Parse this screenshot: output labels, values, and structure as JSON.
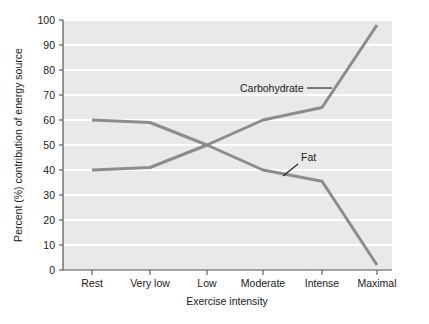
{
  "chart_data": {
    "type": "line",
    "title": "",
    "subtitle": "",
    "xlabel": "Exercise intensity",
    "ylabel": "Percent (%) contribution of energy source",
    "categories": [
      "Rest",
      "Very low",
      "Low",
      "Moderate",
      "Intense",
      "Maximal"
    ],
    "series": [
      {
        "name": "Carbohydrate",
        "color": "#8c8c8c",
        "values": [
          40,
          41,
          50,
          60,
          65,
          98
        ]
      },
      {
        "name": "Fat",
        "color": "#8c8c8c",
        "values": [
          60,
          59,
          50,
          40,
          35.5,
          2
        ]
      }
    ],
    "ylim": [
      0,
      100
    ],
    "ytick_step": 10,
    "yticks": [
      "0",
      "10",
      "20",
      "30",
      "40",
      "50",
      "60",
      "70",
      "80",
      "90",
      "100"
    ],
    "grid": "horizontal-white-gridlines",
    "legend": "none-inline-annotations",
    "annotations": [
      {
        "text": "Carbohydrate",
        "series": "Carbohydrate",
        "leader": "horizontal-dash-right"
      },
      {
        "text": "Fat",
        "series": "Fat",
        "leader": "diagonal-down-left"
      }
    ],
    "plot_background": "#e9e9e9",
    "gridline_color": "#ffffff",
    "axis_color": "#555555"
  },
  "axis": {
    "y_title": "Percent (%) contribution of energy source",
    "x_title": "Exercise intensity",
    "y_ticks": [
      "100",
      "90",
      "80",
      "70",
      "60",
      "50",
      "40",
      "30",
      "20",
      "10",
      "0"
    ],
    "x_ticks": [
      "Rest",
      "Very low",
      "Low",
      "Moderate",
      "Intense",
      "Maximal"
    ]
  },
  "labels": {
    "carbohydrate": "Carbohydrate",
    "fat": "Fat"
  }
}
